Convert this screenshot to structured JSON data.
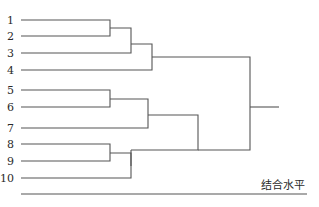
{
  "diagram": {
    "type": "dendrogram",
    "axis_label": "结合水平",
    "leaves": [
      {
        "label": "1",
        "y": 20
      },
      {
        "label": "2",
        "y": 36
      },
      {
        "label": "3",
        "y": 53
      },
      {
        "label": "4",
        "y": 70
      },
      {
        "label": "5",
        "y": 90
      },
      {
        "label": "6",
        "y": 107
      },
      {
        "label": "7",
        "y": 128
      },
      {
        "label": "8",
        "y": 144
      },
      {
        "label": "9",
        "y": 161
      },
      {
        "label": "10",
        "y": 178
      }
    ],
    "merges": [
      {
        "children": [
          "1",
          "2"
        ],
        "level": 110
      },
      {
        "children": [
          "(1,2)",
          "3"
        ],
        "level": 131
      },
      {
        "children": [
          "(1,2,3)",
          "4"
        ],
        "level": 152
      },
      {
        "children": [
          "5",
          "6"
        ],
        "level": 110
      },
      {
        "children": [
          "(5,6)",
          "7"
        ],
        "level": 148
      },
      {
        "children": [
          "8",
          "9"
        ],
        "level": 110
      },
      {
        "children": [
          "(8,9)",
          "10"
        ],
        "level": 131
      },
      {
        "children": [
          "(5,6,7)",
          "(8,9,10)"
        ],
        "level": 198
      },
      {
        "children": [
          "(1,2,3,4)",
          "(5..10)"
        ],
        "level": 250
      }
    ]
  }
}
